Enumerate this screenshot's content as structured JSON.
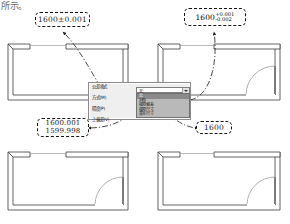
{
  "page": {
    "fragment_text": "所示。",
    "bg_color": "#ffffff",
    "line_color": "#1b1b1b",
    "leader_color": "#2b2b2b"
  },
  "callouts": [
    {
      "id": "callout-top-left",
      "style": "symmetric",
      "text": "1600±0.001",
      "nominal": "1600",
      "tolerance": "±0.001",
      "target_plan": "plan-top-left"
    },
    {
      "id": "callout-top-right",
      "style": "deviation",
      "nominal": "1600",
      "upper": "+0.001",
      "lower": "-0.002",
      "text": "1600 +0.001 / -0.002",
      "target_plan": "plan-top-right"
    },
    {
      "id": "callout-bottom-left",
      "style": "limits",
      "upper_limit": "1600.001",
      "lower_limit": "1599.998",
      "text": "1600.001 / 1599.998",
      "target_plan": "plan-bottom-left"
    },
    {
      "id": "callout-bottom-right",
      "style": "none",
      "text": "1600",
      "nominal": "1600",
      "target_plan": "plan-bottom-right"
    }
  ],
  "dialog": {
    "title": "",
    "labels": [
      {
        "name": "method-label",
        "text": "公差格式"
      },
      {
        "name": "mode-label",
        "text": "方式(M)"
      },
      {
        "name": "precision-label",
        "text": "精度(P)"
      },
      {
        "name": "upper-label",
        "text": "上偏差(V)"
      }
    ],
    "combo": {
      "name": "tolerance-method-combo",
      "value": "无",
      "expanded": true
    },
    "options": [
      {
        "text": "无",
        "state": "selected"
      },
      {
        "text": "对称",
        "state": "normal"
      },
      {
        "text": "极限偏差",
        "state": "highlight"
      },
      {
        "text": "极限尺寸",
        "state": "highlight"
      },
      {
        "text": "基本尺寸",
        "state": "highlight"
      }
    ]
  },
  "plans": [
    {
      "id": "plan-top-left",
      "has_door_arc": false,
      "opening_top": true
    },
    {
      "id": "plan-top-right",
      "has_door_arc": true,
      "opening_top": true
    },
    {
      "id": "plan-bottom-left",
      "has_door_arc": true,
      "opening_top": true
    },
    {
      "id": "plan-bottom-right",
      "has_door_arc": true,
      "opening_top": true
    }
  ]
}
